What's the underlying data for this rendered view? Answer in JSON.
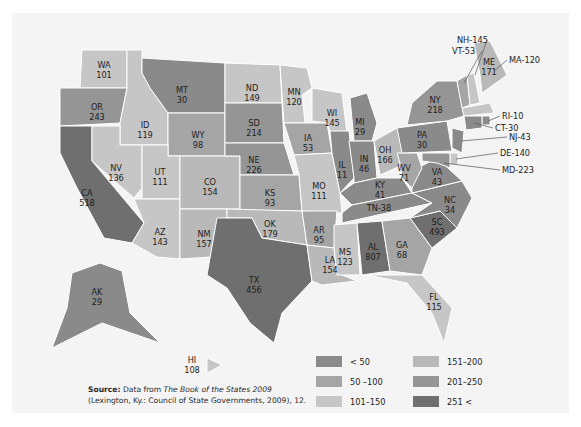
{
  "source": {
    "label": "Source:",
    "text_pre": " Data from ",
    "book": "The Book of the States 2009",
    "text_post": "(Lexington, Ky.: Council of State Governments, 2009), 12."
  },
  "legend": {
    "items": [
      {
        "label": "< 50",
        "color": "#8a8a8a"
      },
      {
        "label": "50 –100",
        "color": "#a5a5a5"
      },
      {
        "label": "101–150",
        "color": "#c6c6c6"
      },
      {
        "label": "151–200",
        "color": "#b9b9b9"
      },
      {
        "label": "201–250",
        "color": "#959595"
      },
      {
        "label": "251 <",
        "color": "#6f6f6f"
      }
    ]
  },
  "chart_data": {
    "type": "choropleth",
    "title": "",
    "bins": [
      {
        "label": "< 50",
        "min": 0,
        "max": 49
      },
      {
        "label": "50 –100",
        "min": 50,
        "max": 100
      },
      {
        "label": "101–150",
        "min": 101,
        "max": 150
      },
      {
        "label": "151–200",
        "min": 151,
        "max": 200
      },
      {
        "label": "201–250",
        "min": 201,
        "max": 250
      },
      {
        "label": "251 <",
        "min": 251,
        "max": null
      }
    ],
    "states": [
      {
        "code": "WA",
        "value": 101
      },
      {
        "code": "OR",
        "value": 243
      },
      {
        "code": "CA",
        "value": 518
      },
      {
        "code": "ID",
        "value": 119
      },
      {
        "code": "NV",
        "value": 136
      },
      {
        "code": "MT",
        "value": 30
      },
      {
        "code": "WY",
        "value": 98
      },
      {
        "code": "UT",
        "value": 111
      },
      {
        "code": "AZ",
        "value": 143
      },
      {
        "code": "CO",
        "value": 154
      },
      {
        "code": "NM",
        "value": 157
      },
      {
        "code": "ND",
        "value": 149
      },
      {
        "code": "SD",
        "value": 214
      },
      {
        "code": "NE",
        "value": 226
      },
      {
        "code": "KS",
        "value": 93
      },
      {
        "code": "OK",
        "value": 179
      },
      {
        "code": "TX",
        "value": 456
      },
      {
        "code": "MN",
        "value": 120
      },
      {
        "code": "IA",
        "value": 53
      },
      {
        "code": "MO",
        "value": 111
      },
      {
        "code": "AR",
        "value": 95
      },
      {
        "code": "LA",
        "value": 154
      },
      {
        "code": "WI",
        "value": 145
      },
      {
        "code": "IL",
        "value": 11
      },
      {
        "code": "MI",
        "value": 29
      },
      {
        "code": "IN",
        "value": 46
      },
      {
        "code": "OH",
        "value": 166
      },
      {
        "code": "KY",
        "value": 41
      },
      {
        "code": "TN",
        "value": 38
      },
      {
        "code": "MS",
        "value": 123
      },
      {
        "code": "AL",
        "value": 807
      },
      {
        "code": "GA",
        "value": 68
      },
      {
        "code": "FL",
        "value": 115
      },
      {
        "code": "SC",
        "value": 493
      },
      {
        "code": "NC",
        "value": 34
      },
      {
        "code": "VA",
        "value": 43
      },
      {
        "code": "WV",
        "value": 71
      },
      {
        "code": "PA",
        "value": 30
      },
      {
        "code": "NY",
        "value": 218
      },
      {
        "code": "VT",
        "value": 53
      },
      {
        "code": "NH",
        "value": 145
      },
      {
        "code": "ME",
        "value": 171
      },
      {
        "code": "MA",
        "value": 120
      },
      {
        "code": "RI",
        "value": 10
      },
      {
        "code": "CT",
        "value": 30
      },
      {
        "code": "NJ",
        "value": 43
      },
      {
        "code": "DE",
        "value": 140
      },
      {
        "code": "MD",
        "value": 223
      },
      {
        "code": "AK",
        "value": 29
      },
      {
        "code": "HI",
        "value": 108
      }
    ],
    "callouts": [
      "NH-145",
      "VT-53",
      "ME",
      "MA-120",
      "RI-10",
      "CT-30",
      "NJ-43",
      "DE-140",
      "MD-223",
      "TN-38"
    ]
  }
}
